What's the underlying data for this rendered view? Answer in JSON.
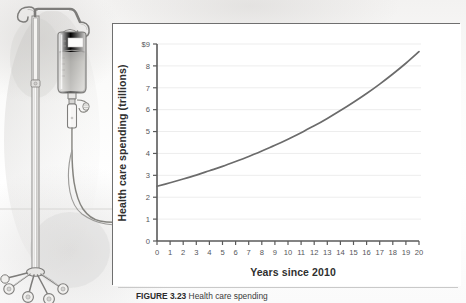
{
  "figure": {
    "caption_label": "FIGURE 3.23",
    "caption_text": "Health care spending"
  },
  "illustration": {
    "name": "iv-drip-stand",
    "description": "Pencil line-art illustration of an intravenous drip bag hanging on a rolling IV pole"
  },
  "colors": {
    "curve": "#6b6b6b",
    "axis": "#5a5a5a",
    "grid": "#ededed",
    "panel_border": "#6f6f6f",
    "tick_text": "#55565a",
    "title_text": "#2f2f2f"
  },
  "chart_data": {
    "type": "line",
    "title": "",
    "xlabel": "Years since 2010",
    "ylabel": "Health care spending (trillions)",
    "xlim": [
      0,
      20
    ],
    "ylim": [
      0,
      9
    ],
    "grid": true,
    "legend": "none",
    "x_tick_labels": [
      "0",
      "1",
      "2",
      "3",
      "4",
      "5",
      "6",
      "7",
      "8",
      "9",
      "10",
      "11",
      "12",
      "13",
      "14",
      "15",
      "16",
      "17",
      "18",
      "19",
      "20"
    ],
    "y_tick_labels": [
      "0",
      "1",
      "2",
      "3",
      "4",
      "5",
      "6",
      "7",
      "8",
      "$9"
    ],
    "x": [
      0,
      1,
      2,
      3,
      4,
      5,
      6,
      7,
      8,
      9,
      10,
      11,
      12,
      13,
      14,
      15,
      16,
      17,
      18,
      19,
      20
    ],
    "series": [
      {
        "name": "Health care spending",
        "values": [
          2.5,
          2.66,
          2.83,
          3.01,
          3.21,
          3.41,
          3.63,
          3.86,
          4.11,
          4.37,
          4.65,
          4.95,
          5.26,
          5.6,
          5.96,
          6.34,
          6.74,
          7.17,
          7.63,
          8.12,
          8.65
        ]
      }
    ]
  }
}
